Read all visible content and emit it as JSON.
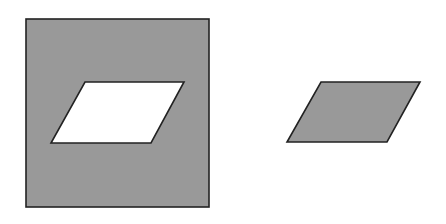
{
  "figure": {
    "fill_color": "#999999",
    "stroke_color": "#222222",
    "hole_color": "#ffffff",
    "square": {
      "x": 26,
      "y": 19,
      "w": 183,
      "h": 188
    },
    "hole_parallelogram": "85,82 184,82 151,143 51,143",
    "separate_parallelogram": "321,82 420,82 387,142 287,142"
  }
}
